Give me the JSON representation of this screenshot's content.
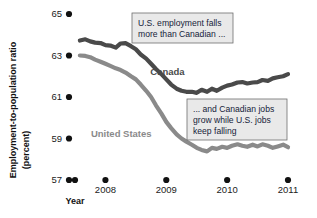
{
  "chart_data": {
    "type": "line",
    "title": "",
    "xlabel": "Year",
    "ylabel": "Employment-to-population ratio (percent)",
    "ylabel_line1": "Employment-to-population ratio",
    "ylabel_line2": "(percent)",
    "grid": false,
    "legend_position": "inline-labels",
    "xlim": [
      2007.5,
      2011.1
    ],
    "ylim": [
      56.4,
      65.6
    ],
    "yticks": [
      57,
      59,
      61,
      63,
      65
    ],
    "ytick_labels": [
      "57",
      "59",
      "61",
      "63",
      "65"
    ],
    "xticks": [
      2007.5,
      2008,
      2009,
      2010,
      2011
    ],
    "xtick_labels": [
      "",
      "2008",
      "2009",
      "2010",
      "2011"
    ],
    "series": [
      {
        "name": "Canada",
        "color": "#4a4a4a",
        "label_x": 2009.02,
        "label_y": 62.05,
        "x": [
          2007.58,
          2007.67,
          2007.75,
          2007.83,
          2007.92,
          2008.0,
          2008.08,
          2008.17,
          2008.25,
          2008.33,
          2008.42,
          2008.5,
          2008.58,
          2008.67,
          2008.75,
          2008.83,
          2008.92,
          2009.0,
          2009.08,
          2009.17,
          2009.25,
          2009.33,
          2009.42,
          2009.5,
          2009.58,
          2009.67,
          2009.75,
          2009.83,
          2009.92,
          2010.0,
          2010.08,
          2010.17,
          2010.25,
          2010.33,
          2010.42,
          2010.5,
          2010.58,
          2010.67,
          2010.75,
          2010.83,
          2010.92,
          2011.0
        ],
        "values": [
          63.72,
          63.78,
          63.68,
          63.62,
          63.6,
          63.5,
          63.48,
          63.38,
          63.58,
          63.6,
          63.45,
          63.3,
          63.05,
          62.85,
          62.6,
          62.35,
          62.1,
          61.85,
          61.6,
          61.4,
          61.3,
          61.25,
          61.25,
          61.2,
          61.35,
          61.25,
          61.4,
          61.3,
          61.45,
          61.55,
          61.6,
          61.7,
          61.72,
          61.65,
          61.7,
          61.72,
          61.82,
          61.78,
          61.9,
          61.95,
          62.0,
          62.1
        ]
      },
      {
        "name": "United States",
        "color": "#8a8a8a",
        "label_x": 2008.26,
        "label_y": 59.05,
        "x": [
          2007.58,
          2007.67,
          2007.75,
          2007.83,
          2007.92,
          2008.0,
          2008.08,
          2008.17,
          2008.25,
          2008.33,
          2008.42,
          2008.5,
          2008.58,
          2008.67,
          2008.75,
          2008.83,
          2008.92,
          2009.0,
          2009.08,
          2009.17,
          2009.25,
          2009.33,
          2009.42,
          2009.5,
          2009.58,
          2009.67,
          2009.75,
          2009.83,
          2009.92,
          2010.0,
          2010.08,
          2010.17,
          2010.25,
          2010.33,
          2010.42,
          2010.5,
          2010.58,
          2010.67,
          2010.75,
          2010.83,
          2010.92,
          2011.0
        ],
        "values": [
          63.0,
          62.98,
          62.92,
          62.8,
          62.7,
          62.6,
          62.5,
          62.38,
          62.3,
          62.18,
          62.0,
          61.85,
          61.6,
          61.3,
          61.0,
          60.6,
          60.2,
          59.8,
          59.5,
          59.2,
          59.0,
          58.85,
          58.7,
          58.55,
          58.45,
          58.38,
          58.55,
          58.5,
          58.6,
          58.55,
          58.65,
          58.72,
          58.65,
          58.6,
          58.7,
          58.62,
          58.72,
          58.65,
          58.55,
          58.62,
          58.7,
          58.58
        ]
      }
    ],
    "annotations": [
      {
        "id": "annotation-us-falls",
        "lines": [
          "U.S. employment falls",
          "more than Canadian ..."
        ],
        "box": {
          "x": 132,
          "y": 13,
          "w": 101,
          "h": 30
        }
      },
      {
        "id": "annotation-canada-grows",
        "lines": [
          "... and Canadian jobs",
          "grow while U.S. jobs",
          "keep falling"
        ],
        "box": {
          "x": 187,
          "y": 99,
          "w": 100,
          "h": 41
        }
      }
    ],
    "colors": {
      "canada": "#4a4a4a",
      "united_states": "#8a8a8a",
      "tick_dot": "#111111",
      "annotation_fill": "#e9e9e9",
      "annotation_stroke": "#6e6e6e",
      "background": "#ffffff"
    }
  }
}
